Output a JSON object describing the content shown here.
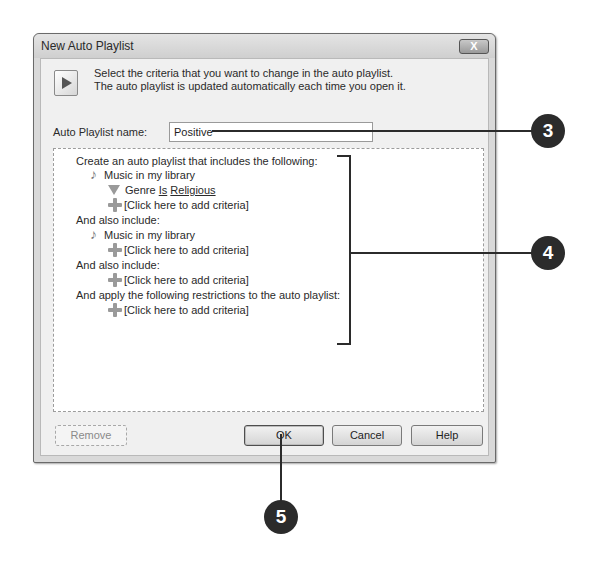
{
  "dialog": {
    "title": "New Auto Playlist",
    "close_label": "X",
    "header": {
      "icon": "auto-playlist-icon",
      "line1": "Select the criteria that you want to change in the auto playlist.",
      "line2": "The auto playlist is updated automatically each time you open it."
    },
    "name_field": {
      "label": "Auto Playlist name:",
      "value": "Positive"
    },
    "criteria": {
      "section1_heading": "Create an auto playlist that includes the following:",
      "section1_source": {
        "icon": "music-note-icon",
        "label": "Music in my library"
      },
      "section1_filter": {
        "icon": "funnel-icon",
        "field": "Genre",
        "operator": "Is",
        "value": "Religious"
      },
      "section1_add": {
        "icon": "plus-icon",
        "label": "[Click here to add criteria]"
      },
      "section2_heading": "And also include:",
      "section2_source": {
        "icon": "music-note-icon",
        "label": "Music in my library"
      },
      "section2_add": {
        "icon": "plus-icon",
        "label": "[Click here to add criteria]"
      },
      "section3_heading": "And also include:",
      "section3_add": {
        "icon": "plus-icon",
        "label": "[Click here to add criteria]"
      },
      "section4_heading": "And apply the following restrictions to the auto playlist:",
      "section4_add": {
        "icon": "plus-icon",
        "label": "[Click here to add criteria]"
      }
    },
    "buttons": {
      "remove": "Remove",
      "ok": "OK",
      "cancel": "Cancel",
      "help": "Help"
    }
  },
  "callouts": {
    "c3": "3",
    "c4": "4",
    "c5": "5",
    "color": "#2b2b2b"
  }
}
